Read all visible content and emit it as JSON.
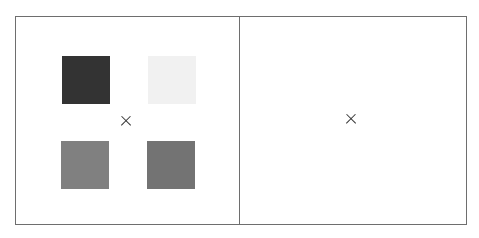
{
  "panels": [
    {
      "name": "stimulus-panel",
      "fixation": {
        "glyph": "×",
        "x": 126,
        "y": 121
      },
      "squares": [
        {
          "position": "top-left",
          "color": "#333333",
          "x": 62,
          "y": 56
        },
        {
          "position": "top-right",
          "color": "#f1f1f1",
          "x": 148,
          "y": 56
        },
        {
          "position": "bottom-left",
          "color": "#808080",
          "x": 61,
          "y": 141
        },
        {
          "position": "bottom-right",
          "color": "#737373",
          "x": 147,
          "y": 141
        }
      ]
    },
    {
      "name": "blank-panel",
      "fixation": {
        "glyph": "×",
        "x": 351,
        "y": 119
      },
      "squares": []
    }
  ],
  "colors": {
    "border": "#6e6e6e",
    "background": "#ffffff"
  }
}
